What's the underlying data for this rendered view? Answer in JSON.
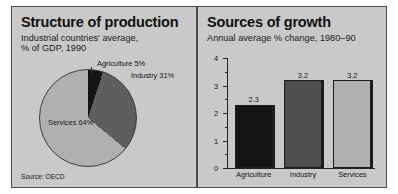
{
  "figure": {
    "background": "#ffffff",
    "panel_background": "#c9c9c9",
    "panel_border": "#4a4a4a"
  },
  "left_panel": {
    "title": "Structure of production",
    "subtitle_line1": "Industrial countries' average,",
    "subtitle_line2": "% of GDP, 1990",
    "source": "Source: OECD",
    "labels": {
      "agriculture": "Agriculture 5%",
      "industry": "Industry 31%",
      "services": "Services 64%"
    }
  },
  "right_panel": {
    "title": "Sources of growth",
    "subtitle": "Annual average % change, 1980–90"
  },
  "chart_data": [
    {
      "type": "pie",
      "title": "Structure of production",
      "subtitle": "Industrial countries' average, % of GDP, 1990",
      "source": "Source: OECD",
      "unit": "% of GDP",
      "year": 1990,
      "labels": [
        "Agriculture",
        "Industry",
        "Services"
      ],
      "values": [
        5,
        31,
        64
      ],
      "value_labels": [
        "Agriculture 5%",
        "Industry 31%",
        "Services 64%"
      ],
      "colors": [
        "#141414",
        "#5e5e5e",
        "#b0b0b0"
      ],
      "legend": "inline-labels",
      "start_angle_deg": 0,
      "direction": "clockwise"
    },
    {
      "type": "bar",
      "title": "Sources of growth",
      "subtitle": "Annual average % change, 1980–90",
      "xlabel": "",
      "ylabel": "",
      "unit": "% change per year",
      "period": "1980–90",
      "categories": [
        "Agriculture",
        "Industry",
        "Services"
      ],
      "values": [
        2.3,
        3.2,
        3.2
      ],
      "value_labels": [
        "2.3",
        "3.2",
        "3.2"
      ],
      "colors": [
        "#141414",
        "#4f4f4f",
        "#b0b0b0"
      ],
      "ylim": [
        0,
        4
      ],
      "yticks": [
        0,
        1,
        2,
        3,
        4
      ],
      "ytick_labels": [
        "0",
        "1",
        "2",
        "3",
        "4"
      ],
      "yminor_ticks": [
        0.5,
        1.5,
        2.5,
        3.5
      ],
      "grid": false,
      "legend": "none"
    }
  ]
}
